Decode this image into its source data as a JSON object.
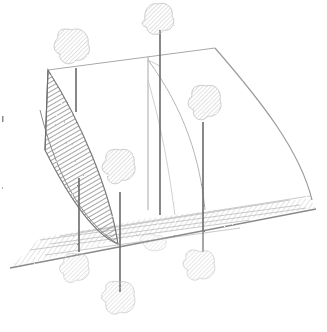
{
  "artwork": {
    "medium": "pencil sketch",
    "subject": "3D geometric surfaces with trees",
    "palette": {
      "background": "#ffffff",
      "graphite_dark": "#6a6a6a",
      "graphite_mid": "#9a9a9a",
      "graphite_light": "#c8c8c8",
      "shade_fill": "#b0b0b0",
      "foliage": "#cfcfcf"
    },
    "trees": [
      {
        "name": "tree-top-center",
        "canopy": [
          158,
          18
        ],
        "trunk_base": [
          160,
          215
        ]
      },
      {
        "name": "tree-left",
        "canopy": [
          74,
          45
        ],
        "trunk_base": [
          76,
          98
        ]
      },
      {
        "name": "tree-right",
        "canopy": [
          206,
          103
        ],
        "trunk_base": [
          203,
          230
        ]
      },
      {
        "name": "tree-middle",
        "canopy": [
          121,
          170
        ],
        "trunk_base": [
          120,
          240
        ]
      },
      {
        "name": "tree-reflection-left",
        "canopy": [
          75,
          270
        ],
        "trunk_base": [
          79,
          250
        ]
      },
      {
        "name": "tree-reflection-center",
        "canopy": [
          121,
          300
        ],
        "trunk_base": [
          120,
          245
        ]
      },
      {
        "name": "tree-reflection-right",
        "canopy": [
          200,
          267
        ],
        "trunk_base": [
          203,
          240
        ]
      }
    ]
  }
}
